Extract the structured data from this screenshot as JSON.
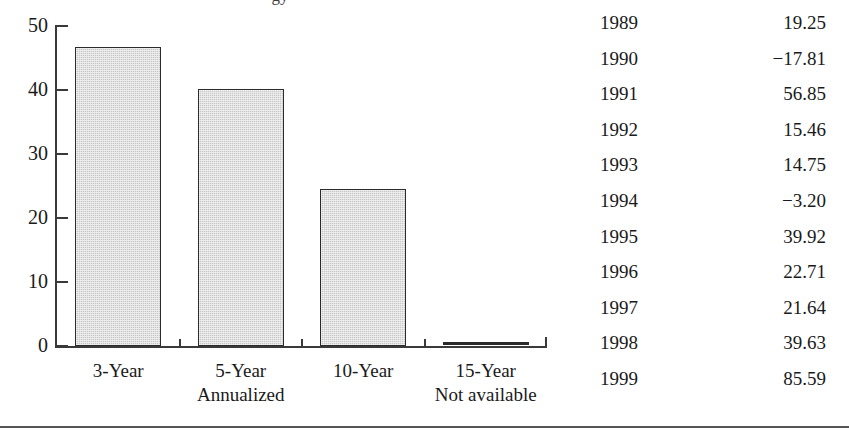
{
  "figure": {
    "clipped_title_fragment": "gy",
    "bottom_rule": true
  },
  "chart_data": {
    "type": "bar",
    "title": "",
    "subtitle": "",
    "xlabel": "",
    "ylabel": "",
    "categories": [
      "3-Year",
      "5-Year",
      "10-Year",
      "15-Year"
    ],
    "values": [
      46.7,
      40.1,
      24.5,
      0
    ],
    "value_notes": [
      "",
      "",
      "",
      "Not available"
    ],
    "category_sublabels": [
      "",
      "Annualized",
      "",
      "Not available"
    ],
    "ylim": [
      0,
      50
    ],
    "yticks": [
      0,
      10,
      20,
      30,
      40,
      50
    ],
    "ytick_labels": [
      "0",
      "10",
      "20",
      "30",
      "40",
      "50"
    ],
    "grid": false,
    "legend": "none",
    "bar_fill_color": "#c9c9c9",
    "bar_edge_color": "#2b2b2b",
    "axis_color": "#3a3a3a"
  },
  "table": {
    "columns": [
      "Year",
      "Return"
    ],
    "rows": [
      {
        "year": "1989",
        "value": "19.25"
      },
      {
        "year": "1990",
        "value": "−17.81"
      },
      {
        "year": "1991",
        "value": "56.85"
      },
      {
        "year": "1992",
        "value": "15.46"
      },
      {
        "year": "1993",
        "value": "14.75"
      },
      {
        "year": "1994",
        "value": "−3.20"
      },
      {
        "year": "1995",
        "value": "39.92"
      },
      {
        "year": "1996",
        "value": "22.71"
      },
      {
        "year": "1997",
        "value": "21.64"
      },
      {
        "year": "1998",
        "value": "39.63"
      },
      {
        "year": "1999",
        "value": "85.59"
      }
    ]
  }
}
